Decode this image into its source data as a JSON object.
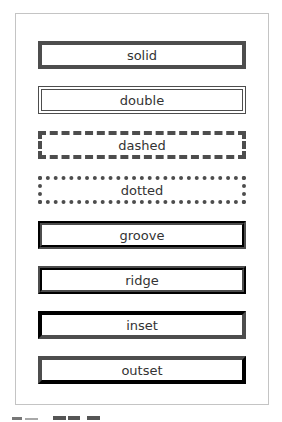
{
  "theme": {
    "page_background": "#ffffff",
    "panel_border_color": "#c4c4c4",
    "box_border_color": "#4d4d4d",
    "text_color": "#333333"
  },
  "boxes": [
    {
      "label": "solid",
      "style": "solid"
    },
    {
      "label": "double",
      "style": "double"
    },
    {
      "label": "dashed",
      "style": "dashed"
    },
    {
      "label": "dotted",
      "style": "dotted"
    },
    {
      "label": "groove",
      "style": "groove"
    },
    {
      "label": "ridge",
      "style": "ridge"
    },
    {
      "label": "inset",
      "style": "inset"
    },
    {
      "label": "outset",
      "style": "outset"
    }
  ]
}
